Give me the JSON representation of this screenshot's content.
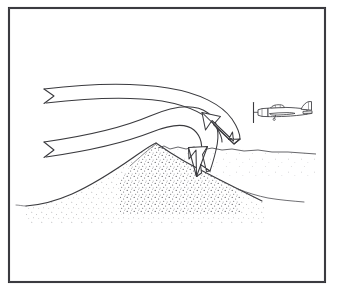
{
  "figure": {
    "alt_text": "Pen-and-ink line drawing: two broad ribbon arrows of air flow from the left, bend over a stippled mountain peak and curve sharply downward on the lee side, where a small propeller aircraft flies.",
    "background_color": "#ffffff",
    "ink_color": "#2a2a2a",
    "stipple_color": "#55555a"
  },
  "frame": {
    "name": "border-frame",
    "x": 8,
    "y": 7,
    "width": 318,
    "height": 276,
    "stroke_color": "#2c2c30",
    "stroke_width": 2
  },
  "terrain": {
    "name": "mountain-ridge",
    "label": "mountain",
    "fill": "none",
    "outline_color": "#3a3a3e",
    "stipple_density": "medium",
    "peak": {
      "x": 155,
      "y": 146
    },
    "left_base": {
      "x": 42,
      "y": 203
    },
    "right_base": {
      "x": 250,
      "y": 196
    },
    "ridge_path": "M 42 203 C 66 199 86 190 104 180 C 122 170 138 158 152 147 L 156 145 C 168 152 178 158 190 163 C 204 169 222 176 240 183 C 252 188 262 192 268 196",
    "horizon_left_path": "M 42 203 C 36 203 32 203 28 203",
    "horizon_right_path": "M 158 147 C 172 146 182 149 196 148 C 208 147 218 150 232 149 C 248 148 266 151 288 151 C 300 151 308 152 314 153"
  },
  "flow_arrows": [
    {
      "name": "upper-flow-arrow",
      "label": "upper airflow streamline",
      "description": "Broad ribbon arrow entering upper-left with notched tail, sweeping right and curving down past the peak toward the aircraft.",
      "tail_notched": true,
      "outer_path": "M 44 89 C 86 84 130 82 168 88 C 200 93 222 104 232 118 C 238 127 240 134 240 140",
      "inner_path": "M 46 103 C 88 98 128 96 162 101 C 190 106 208 114 216 126 C 221 133 222 137 222 141",
      "tail_notch_path": "M 44 89 L 54 96 L 44 103",
      "head": {
        "name": "upper-arrowhead",
        "tip": {
          "x": 233,
          "y": 140
        },
        "direction_deg": 62,
        "path": "M 240 140 L 223 140 L 230 132 L 211 120 L 206 131 L 201 112 L 220 117 L 214 125 L 233 137 Z"
      }
    },
    {
      "name": "lower-flow-arrow",
      "label": "lower airflow streamline",
      "description": "Second broad ribbon arrow entering lower-left with notched tail, riding up over the ridge crest and plunging down the lee slope.",
      "tail_notched": true,
      "outer_path": "M 44 142 C 86 136 122 128 150 116 C 176 105 196 103 208 112 C 218 120 220 134 216 150 C 214 160 212 166 210 172",
      "inner_path": "M 46 157 C 88 151 124 142 152 131 C 172 123 186 122 194 129 C 202 136 203 148 200 160 C 198 168 197 171 196 175",
      "tail_notch_path": "M 44 142 L 54 150 L 44 158",
      "head": {
        "name": "lower-arrowhead",
        "tip": {
          "x": 203,
          "y": 177
        },
        "direction_deg": 92,
        "path": "M 210 172 L 199 165 L 199 174 L 196 150 L 189 160 L 189 148 L 207 147 L 202 155 L 207 172 Z"
      }
    }
  ],
  "aircraft": {
    "name": "airplane",
    "label": "propeller aircraft",
    "type": "single-engine-propeller",
    "heading": "left",
    "position": {
      "x": 253,
      "y": 104,
      "width": 62,
      "height": 26
    },
    "parts": [
      {
        "name": "propeller-blade",
        "label": "propeller"
      },
      {
        "name": "spinner",
        "label": "spinner"
      },
      {
        "name": "engine-cowling",
        "label": "cowling"
      },
      {
        "name": "canopy",
        "label": "canopy"
      },
      {
        "name": "fuselage",
        "label": "fuselage"
      },
      {
        "name": "wing",
        "label": "wing"
      },
      {
        "name": "tailplane",
        "label": "horizontal stabilizer"
      },
      {
        "name": "vertical-fin",
        "label": "vertical fin"
      },
      {
        "name": "landing-gear",
        "label": "main gear"
      }
    ]
  }
}
